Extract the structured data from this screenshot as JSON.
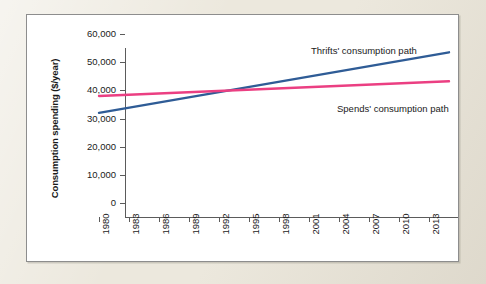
{
  "chart_data": {
    "type": "line",
    "title": "",
    "xlabel": "Year",
    "ylabel": "Consumption spending ($/year)",
    "xlim": [
      1980,
      2016
    ],
    "ylim": [
      0,
      60000
    ],
    "grid": false,
    "legend_position": "inline-annotation",
    "x_ticks": [
      "1980",
      "1983",
      "1986",
      "1989",
      "1992",
      "1995",
      "1998",
      "2001",
      "2004",
      "2007",
      "2010",
      "2013"
    ],
    "y_ticks": [
      "0",
      "10,000",
      "20,000",
      "30,000",
      "40,000",
      "50,000",
      "60,000"
    ],
    "y_tick_values": [
      0,
      10000,
      20000,
      30000,
      40000,
      50000,
      60000
    ],
    "annotations": [
      {
        "text": "Thrifts' consumption path",
        "series": "thrifts"
      },
      {
        "text": "Spends' consumption path",
        "series": "spends"
      }
    ],
    "series": [
      {
        "name": "Thrifts' consumption path",
        "label": "Thrifts' consumption path",
        "color": "#2f5c96",
        "x": [
          1980,
          2015
        ],
        "values": [
          32000,
          53500
        ]
      },
      {
        "name": "Spends' consumption path",
        "label": "Spends' consumption path",
        "color": "#eb3f82",
        "x": [
          1980,
          2015
        ],
        "values": [
          38000,
          43200
        ]
      }
    ],
    "crossing_point": {
      "year": 1996,
      "value": 40200
    }
  },
  "figure": {
    "panel_background": "#ffffff",
    "mat_background": "#ece8dd",
    "axis_color": "#5b5b5b"
  }
}
